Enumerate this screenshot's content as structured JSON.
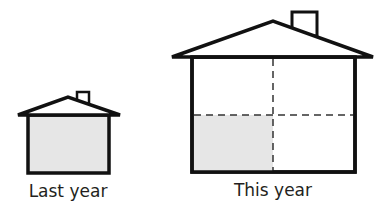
{
  "diagram": {
    "houses": [
      {
        "id": "last-year",
        "label": "Last year",
        "shaded_fraction": 1.0,
        "grid": null
      },
      {
        "id": "this-year",
        "label": "This year",
        "shaded_fraction": 0.25,
        "grid": "2x2 dashed"
      }
    ],
    "colors": {
      "outline": "#111111",
      "shade": "#e6e6e6",
      "dash": "#333333"
    }
  }
}
